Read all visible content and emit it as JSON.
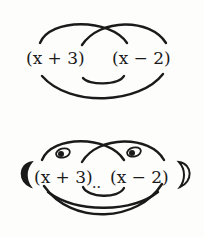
{
  "top_diagram": {
    "left_factor": "(x + 3)",
    "right_factor": "(x − 2)",
    "description": "FOIL arcs connecting terms of two binomials"
  },
  "bottom_diagram": {
    "left_factor": "(x + 3)",
    "separator": "..",
    "right_factor": "(x − 2)",
    "description": "FOIL arcs drawn as a smiling face with eyes, ears, nose dots and mouth"
  },
  "colors": {
    "ink": "#1a1a1a",
    "background": "#fdfdfc"
  }
}
